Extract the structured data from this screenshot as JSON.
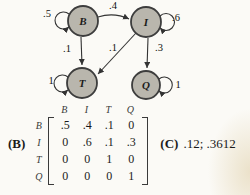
{
  "diagram": {
    "nodes": {
      "b": "B",
      "i": "I",
      "t": "T",
      "q": "Q"
    },
    "edge_labels": {
      "b_self": ".5",
      "b_to_i": ".4",
      "i_self": ".6",
      "b_to_t": ".1",
      "i_to_t": ".1",
      "i_to_q": ".3",
      "t_self": "1",
      "q_self": "1"
    },
    "colors": {
      "node_fill": "#b9b6ad",
      "node_stroke": "#3d3d3d",
      "edge": "#333333"
    }
  },
  "matrix": {
    "figure_label": "(B)",
    "col_headers": [
      "B",
      "I",
      "T",
      "Q"
    ],
    "rows": [
      {
        "label": "B",
        "values": [
          ".5",
          ".4",
          ".1",
          "0"
        ]
      },
      {
        "label": "I",
        "values": [
          "0",
          ".6",
          ".1",
          ".3"
        ]
      },
      {
        "label": "T",
        "values": [
          "0",
          "0",
          "1",
          "0"
        ]
      },
      {
        "label": "Q",
        "values": [
          "0",
          "0",
          "0",
          "1"
        ]
      }
    ]
  },
  "answer": {
    "figure_label": "(C)",
    "value": ".12; .3612"
  }
}
